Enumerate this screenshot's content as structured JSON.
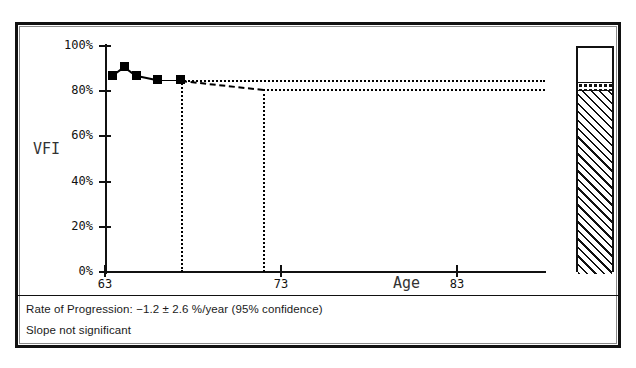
{
  "chart_data": {
    "type": "scatter",
    "title": "",
    "xlabel": "Age",
    "ylabel": "VFI",
    "xlim": [
      63,
      88
    ],
    "ylim": [
      0,
      100
    ],
    "grid": false,
    "legend": "none",
    "x_ticks": [
      {
        "value": 63,
        "label": "63"
      },
      {
        "value": 73,
        "label": "73"
      },
      {
        "value": 83,
        "label": "83"
      }
    ],
    "y_ticks": [
      {
        "value": 0,
        "label": "0%"
      },
      {
        "value": 20,
        "label": "20%"
      },
      {
        "value": 40,
        "label": "40%"
      },
      {
        "value": 60,
        "label": "60%"
      },
      {
        "value": 80,
        "label": "80%"
      },
      {
        "value": 100,
        "label": "100%"
      }
    ],
    "series": [
      {
        "name": "VFI measurements",
        "marker": "filled-square",
        "points": [
          {
            "x": 63.4,
            "y": 87
          },
          {
            "x": 64.1,
            "y": 91
          },
          {
            "x": 64.8,
            "y": 87
          },
          {
            "x": 66.0,
            "y": 85
          },
          {
            "x": 67.3,
            "y": 85
          }
        ]
      }
    ],
    "trend": {
      "name": "Regression / projection",
      "style": "dashed",
      "from": {
        "x": 67.3,
        "y": 85
      },
      "to": {
        "x": 72.0,
        "y": 81
      }
    },
    "confidence_lines": [
      {
        "style": "dotted",
        "y": 85,
        "from_x": 67.3,
        "to_x": 88.0
      },
      {
        "style": "dotted",
        "y": 81,
        "from_x": 72.0,
        "to_x": 88.0
      }
    ],
    "vertical_markers": [
      {
        "style": "dotted",
        "x": 67.3,
        "from_y": 0,
        "to_y": 85
      },
      {
        "style": "dotted",
        "x": 72.0,
        "from_y": 0,
        "to_y": 81
      }
    ],
    "side_bar": {
      "name": "VFI summary bar",
      "segments": [
        {
          "label": "remaining",
          "fill": "white",
          "from": 85,
          "to": 100
        },
        {
          "label": "confidence-band",
          "fill": "dotted",
          "from": 81,
          "to": 85
        },
        {
          "label": "current-vfi",
          "fill": "diagonal-hatch",
          "from": 0,
          "to": 81
        }
      ]
    },
    "annotations": [
      "Rate of Progression: −1.2 ± 2.6 %/year (95% confidence)",
      "Slope not significant"
    ]
  },
  "footer": {
    "rate_of_progression": "Rate of Progression: −1.2 ± 2.6 %/year (95% confidence)",
    "significance": "Slope not significant"
  }
}
